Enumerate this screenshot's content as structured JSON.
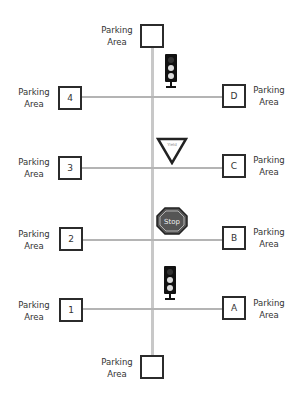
{
  "diagram": {
    "title": "",
    "road_color": "#c8c8c8",
    "box_border_color": "#2b2b2b",
    "parking_label_line1": "Parking",
    "parking_label_line2": "Area",
    "parking_areas": [
      {
        "id": "top",
        "label": ""
      },
      {
        "id": "4",
        "label": "4"
      },
      {
        "id": "D",
        "label": "D"
      },
      {
        "id": "3",
        "label": "3"
      },
      {
        "id": "C",
        "label": "C"
      },
      {
        "id": "2",
        "label": "2"
      },
      {
        "id": "B",
        "label": "B"
      },
      {
        "id": "1",
        "label": "1"
      },
      {
        "id": "A",
        "label": "A"
      },
      {
        "id": "bottom",
        "label": ""
      }
    ],
    "signs": {
      "yield_text": "Yield",
      "stop_text": "Stop"
    }
  }
}
